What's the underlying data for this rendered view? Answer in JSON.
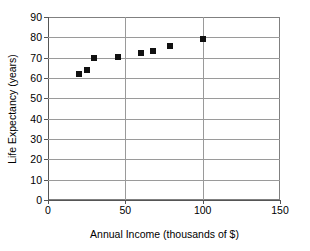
{
  "chart_data": {
    "type": "scatter",
    "title": "",
    "xlabel": "Annual Income (thousands of $)",
    "ylabel": "Life Expectancy (years)",
    "xlim": [
      0,
      150
    ],
    "ylim": [
      0,
      90
    ],
    "xticks": [
      "0",
      "50",
      "100",
      "150"
    ],
    "xtick_values": [
      0,
      50,
      100,
      150
    ],
    "yticks": [
      "0",
      "10",
      "20",
      "30",
      "40",
      "50",
      "60",
      "70",
      "80",
      "90"
    ],
    "ytick_values": [
      0,
      10,
      20,
      30,
      40,
      50,
      60,
      70,
      80,
      90
    ],
    "grid": "horizontal-and-vertical",
    "legend": "none",
    "marker": "filled-square",
    "marker_color": "#111111",
    "points": [
      {
        "x": 20,
        "y": 62.0
      },
      {
        "x": 25,
        "y": 64.0
      },
      {
        "x": 30,
        "y": 70.0
      },
      {
        "x": 45,
        "y": 70.3
      },
      {
        "x": 60,
        "y": 72.5
      },
      {
        "x": 68,
        "y": 73.5
      },
      {
        "x": 79,
        "y": 75.5
      },
      {
        "x": 100,
        "y": 79.0
      }
    ],
    "x": [
      20,
      25,
      30,
      45,
      60,
      68,
      79,
      100
    ],
    "values": [
      62.0,
      64.0,
      70.0,
      70.3,
      72.5,
      73.5,
      75.5,
      79.0
    ]
  },
  "colors": {
    "grid": "#9a9a9a",
    "axis": "#555555",
    "marker": "#111111",
    "background": "#ffffff"
  }
}
